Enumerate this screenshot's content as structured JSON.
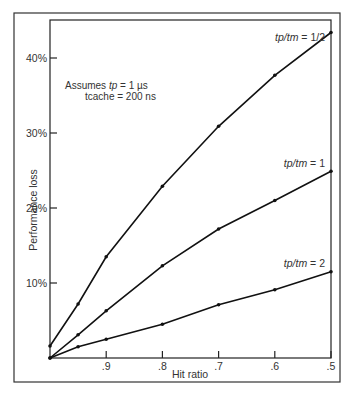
{
  "chart_data": {
    "type": "line",
    "title": "",
    "xlabel": "Hit ratio",
    "ylabel": "Performance loss",
    "x": [
      1.0,
      0.95,
      0.9,
      0.8,
      0.7,
      0.6,
      0.5
    ],
    "xlim": [
      1.0,
      0.5
    ],
    "xticks": [
      0.9,
      0.8,
      0.7,
      0.6,
      0.5
    ],
    "xtick_labels": [
      ".9",
      ".8",
      ".7",
      ".6",
      ".5"
    ],
    "ylim": [
      0,
      45
    ],
    "yticks": [
      10,
      20,
      30,
      40
    ],
    "ytick_labels": [
      "10%",
      "20%",
      "30%",
      "40%"
    ],
    "grid": false,
    "annotation": {
      "line1_prefix": "Assumes ",
      "line1_var": "tp",
      "line1_suffix": " = 1 µs",
      "line2": "tcache = 200 ns"
    },
    "series": [
      {
        "name": "tp/tm = 1/2",
        "label_var": "tp/tm",
        "label_value": " = 1/2",
        "values": [
          1.6,
          7.2,
          13.5,
          22.9,
          30.9,
          37.7,
          43.4
        ]
      },
      {
        "name": "tp/tm = 1",
        "label_var": "tp/tm",
        "label_value": " = 1",
        "values": [
          0.0,
          3.1,
          6.3,
          12.3,
          17.2,
          21.0,
          24.9
        ]
      },
      {
        "name": "tp/tm = 2",
        "label_var": "tp/tm",
        "label_value": " = 2",
        "values": [
          0.0,
          1.5,
          2.5,
          4.5,
          7.1,
          9.1,
          11.5
        ]
      }
    ]
  },
  "colors": {
    "line": "#111111",
    "frame": "#333333",
    "text": "#333333"
  }
}
